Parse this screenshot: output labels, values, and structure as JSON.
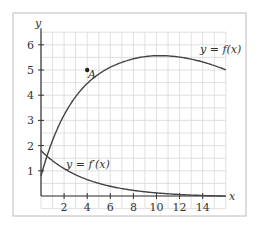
{
  "figure": {
    "y_axis_label": "y",
    "x_axis_label": "x",
    "y_ticks": [
      "1",
      "2",
      "3",
      "4",
      "5",
      "6"
    ],
    "x_ticks": [
      "2",
      "4",
      "6",
      "8",
      "10",
      "12",
      "14"
    ],
    "curve_f_label": "y = f(x)",
    "curve_fprime_label": "y = f′(x)",
    "point_label": "A",
    "point_A": {
      "x": 4,
      "y": 5
    }
  },
  "chart_data": {
    "type": "line",
    "title": "",
    "xlabel": "x",
    "ylabel": "y",
    "xlim": [
      0,
      16
    ],
    "ylim": [
      0,
      6.5
    ],
    "grid": true,
    "series": [
      {
        "name": "y = f(x)",
        "x": [
          0,
          1,
          2,
          3,
          4,
          5,
          6,
          7,
          8,
          9,
          10,
          11,
          12,
          13,
          14,
          15,
          16
        ],
        "y": [
          0.8,
          2.4,
          3.6,
          4.4,
          5.0,
          5.35,
          5.6,
          5.75,
          5.8,
          5.8,
          5.75,
          5.65,
          5.5,
          5.35,
          5.15,
          4.95,
          4.7
        ]
      },
      {
        "name": "y = f'(x)",
        "x": [
          0,
          1,
          2,
          3,
          4,
          5,
          6,
          7,
          8,
          9,
          10,
          11,
          12,
          13,
          14,
          15,
          16
        ],
        "y": [
          1.8,
          1.45,
          1.15,
          0.9,
          0.7,
          0.55,
          0.4,
          0.3,
          0.22,
          0.15,
          0.1,
          0.06,
          0.03,
          0.01,
          0.0,
          -0.02,
          -0.03
        ]
      }
    ],
    "annotations": [
      {
        "label": "A",
        "x": 4,
        "y": 5
      }
    ]
  }
}
